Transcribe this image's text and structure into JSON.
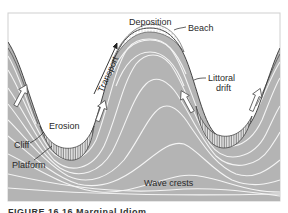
{
  "figure": {
    "labels": {
      "deposition": "Deposition",
      "beach": "Beach",
      "transport": "Transport",
      "littoral_drift_line1": "Littoral",
      "littoral_drift_line2": "drift",
      "erosion": "Erosion",
      "cliff": "Cliff",
      "platform": "Platform",
      "wave_crests": "Wave crests"
    },
    "caption": "FIGURE 16.16  Marginal Idiom..."
  },
  "colors": {
    "water": "#b4b4b4",
    "wave_crest_line": "#f4f4f4",
    "land": "#ffffff",
    "frame": "#cfcfcf",
    "ink": "#2a2a2a"
  }
}
